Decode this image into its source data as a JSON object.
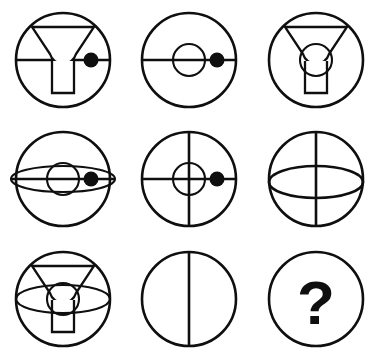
{
  "puzzle": {
    "title": "Raven's progressive matrix puzzle",
    "type": "visual-analogy-matrix",
    "rows": 3,
    "columns": 3,
    "background_color": "#ffffff",
    "stroke_color": "#0f0f0f",
    "cells": [
      {
        "id": "cell-1",
        "row": 1,
        "column": 1,
        "label": "circle with horizontal diameter, trophy figure and filled dot",
        "elements": [
          "outer-circle",
          "horizontal-line",
          "trophy",
          "filled-dot"
        ],
        "answer_marker": false
      },
      {
        "id": "cell-2",
        "row": 1,
        "column": 2,
        "label": "circle with horizontal diameter, small inner circle and filled dot",
        "elements": [
          "outer-circle",
          "horizontal-line",
          "inner-circle",
          "filled-dot"
        ],
        "answer_marker": false
      },
      {
        "id": "cell-3",
        "row": 1,
        "column": 3,
        "label": "circle with trophy figure and small inner circle",
        "elements": [
          "outer-circle",
          "trophy",
          "inner-circle"
        ],
        "answer_marker": false
      },
      {
        "id": "cell-4",
        "row": 2,
        "column": 1,
        "label": "circle with lens ellipse, horizontal diameter, small inner circle and filled dot",
        "elements": [
          "outer-circle",
          "lens-ellipse",
          "horizontal-line",
          "inner-circle",
          "filled-dot"
        ],
        "answer_marker": false
      },
      {
        "id": "cell-5",
        "row": 2,
        "column": 2,
        "label": "circle with horizontal and vertical diameters, small inner circle and filled dot",
        "elements": [
          "outer-circle",
          "horizontal-line",
          "vertical-line",
          "inner-circle",
          "filled-dot"
        ],
        "answer_marker": false
      },
      {
        "id": "cell-6",
        "row": 2,
        "column": 3,
        "label": "circle with vertical diameter and wide ellipse",
        "elements": [
          "outer-circle",
          "vertical-line",
          "wide-ellipse"
        ],
        "answer_marker": false
      },
      {
        "id": "cell-7",
        "row": 3,
        "column": 1,
        "label": "circle with trophy figure, small inner circle and wide ellipse",
        "elements": [
          "outer-circle",
          "trophy",
          "inner-circle",
          "wide-ellipse"
        ],
        "answer_marker": false
      },
      {
        "id": "cell-8",
        "row": 3,
        "column": 2,
        "label": "circle with vertical diameter only",
        "elements": [
          "outer-circle",
          "vertical-line"
        ],
        "answer_marker": false
      },
      {
        "id": "cell-9",
        "row": 3,
        "column": 3,
        "label": "circle containing a question mark placeholder for the missing answer",
        "elements": [
          "outer-circle",
          "question-mark"
        ],
        "answer_marker": true,
        "question_mark": "?"
      }
    ]
  }
}
